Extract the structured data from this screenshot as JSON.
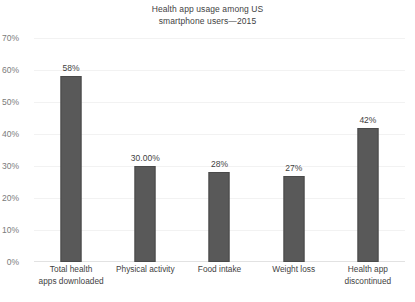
{
  "chart_data": {
    "type": "bar",
    "title": "Health app usage among US smartphone users—2015",
    "title_lines": [
      "Health app usage among US",
      "smartphone users—2015"
    ],
    "categories": [
      "Total health apps downloaded",
      "Physical activity",
      "Food intake",
      "Weight loss",
      "Health app discontinued"
    ],
    "category_lines": [
      [
        "Total health",
        "apps downloaded"
      ],
      [
        "Physical activity"
      ],
      [
        "Food intake"
      ],
      [
        "Weight loss"
      ],
      [
        "Health app",
        "discontinued"
      ]
    ],
    "values": [
      58,
      30,
      28,
      27,
      42
    ],
    "data_labels": [
      "58%",
      "30.00%",
      "28%",
      "27%",
      "42%"
    ],
    "xlabel": "",
    "ylabel": "",
    "ylim": [
      0,
      70
    ],
    "ytick_values": [
      0,
      10,
      20,
      30,
      40,
      50,
      60,
      70
    ],
    "ytick_labels": [
      "0%",
      "10%",
      "20%",
      "30%",
      "40%",
      "50%",
      "60%",
      "70%"
    ],
    "grid": true,
    "legend": false,
    "bar_color": "#595959",
    "grid_color": "#f2f2f2",
    "axis_text_color": "#7b7b7b",
    "label_text_color": "#3f3f3f",
    "background_color": "#ffffff"
  }
}
